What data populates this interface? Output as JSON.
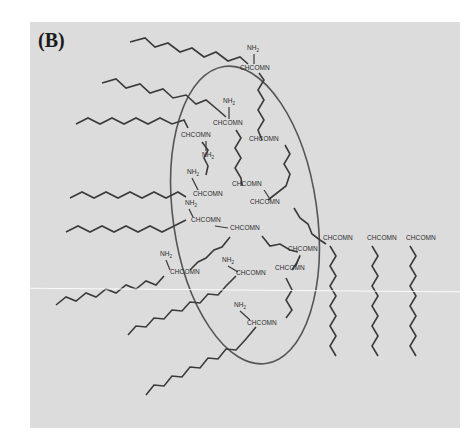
{
  "figure": {
    "panel_label": "(B)",
    "background_color": "#dcdcdc",
    "line_color": "#3a3a3a",
    "ellipse": {
      "cx": 245,
      "cy": 215,
      "rx": 72,
      "ry": 150,
      "rotation": -8
    }
  },
  "labels": [
    {
      "text": "NH2",
      "x": 247,
      "y": 50
    },
    {
      "text": "CHCOMN",
      "x": 240,
      "y": 70
    },
    {
      "text": "NH2",
      "x": 223,
      "y": 103
    },
    {
      "text": "CHCOMN",
      "x": 213,
      "y": 125
    },
    {
      "text": "CHCOMN",
      "x": 181,
      "y": 137
    },
    {
      "text": "CHCOMN",
      "x": 249,
      "y": 141
    },
    {
      "text": "NH2",
      "x": 202,
      "y": 157
    },
    {
      "text": "NH2",
      "x": 187,
      "y": 174
    },
    {
      "text": "CHCOMN",
      "x": 232,
      "y": 186
    },
    {
      "text": "CHCOMN",
      "x": 193,
      "y": 196
    },
    {
      "text": "NH2",
      "x": 185,
      "y": 205
    },
    {
      "text": "CHCOMN",
      "x": 250,
      "y": 204
    },
    {
      "text": "CHCOMN",
      "x": 191,
      "y": 222
    },
    {
      "text": "CHCOMN",
      "x": 230,
      "y": 230
    },
    {
      "text": "CHCOMN",
      "x": 288,
      "y": 251
    },
    {
      "text": "CHCOMN",
      "x": 323,
      "y": 240
    },
    {
      "text": "CHCOMN",
      "x": 367,
      "y": 240
    },
    {
      "text": "CHCOMN",
      "x": 406,
      "y": 240
    },
    {
      "text": "NH2",
      "x": 160,
      "y": 256
    },
    {
      "text": "CHCOMN",
      "x": 170,
      "y": 274
    },
    {
      "text": "NH2",
      "x": 222,
      "y": 262
    },
    {
      "text": "CHCOMN",
      "x": 236,
      "y": 275
    },
    {
      "text": "CHCOMN",
      "x": 275,
      "y": 270
    },
    {
      "text": "NH2",
      "x": 234,
      "y": 307
    },
    {
      "text": "CHCOMN",
      "x": 247,
      "y": 325
    }
  ],
  "chains": [
    {
      "name": "tail-top-1",
      "points": "130,42 145,38 155,47 168,43 180,52 192,48 204,57 216,52 228,61 240,57 248,64"
    },
    {
      "name": "tail-top-2",
      "points": "102,83 116,79 126,88 140,84 150,93 163,89 173,98 186,95 196,104 206,100 218,110 226,117"
    },
    {
      "name": "tail-top-3",
      "points": "76,124 88,118 100,124 112,118 124,124 136,118 148,124 160,118 172,124 184,120 188,128"
    },
    {
      "name": "tail-mid-1",
      "points": "70,198 82,192 94,198 106,192 118,198 130,192 142,198 154,192 166,198 178,192 186,197"
    },
    {
      "name": "tail-mid-2",
      "points": "66,232 78,226 90,232 102,226 114,232 126,226 138,232 150,226 162,232 174,226 186,220"
    },
    {
      "name": "tail-low-1",
      "points": "56,305 66,297 76,301 86,293 96,297 106,289 116,293 126,285 136,289 146,281 156,285 164,276"
    },
    {
      "name": "tail-low-2",
      "points": "128,335 136,326 146,327 154,318 164,319 172,310 182,311 190,302 200,303 208,294 218,295 226,286 236,276"
    },
    {
      "name": "tail-low-3",
      "points": "146,395 154,385 164,386 172,376 182,377 190,367 200,368 208,358 218,359 226,349 236,350 246,339 256,327"
    },
    {
      "name": "backbone-1",
      "points": "259,73 264,80 258,90 264,100 258,110 264,120 258,130 262,140"
    },
    {
      "name": "backbone-2",
      "points": "236,130 241,138 235,148 241,158 235,168 241,178 242,186"
    },
    {
      "name": "backbone-3",
      "points": "202,142 208,150 204,158 208,166 206,175"
    },
    {
      "name": "backbone-4",
      "points": "285,145 290,154 284,164 290,174 286,186 268,200"
    },
    {
      "name": "backbone-5",
      "points": "294,208 300,218 308,224 312,234 320,240 326,244"
    },
    {
      "name": "backbone-6",
      "points": "262,236 270,246 280,244 290,250 298,252"
    },
    {
      "name": "backbone-7",
      "points": "230,237 222,247 214,250 206,258 198,262 190,270"
    },
    {
      "name": "backbone-8",
      "points": "286,278 292,290 286,300 292,310 286,318"
    },
    {
      "name": "backbone-9",
      "points": "300,256 296,264 292,270"
    },
    {
      "name": "pendant-1",
      "points": "330,246 336,256 330,266 336,276 330,286 336,296 330,306 336,316 330,326 336,336 330,346 336,356"
    },
    {
      "name": "pendant-2",
      "points": "372,246 378,256 372,266 378,276 372,286 378,296 372,306 378,316 372,326 378,336 372,346 378,356"
    },
    {
      "name": "pendant-3",
      "points": "410,246 416,256 410,266 416,276 410,286 416,296 410,306 416,316 410,326 416,336 410,346 416,356"
    }
  ],
  "bonds": [
    {
      "x1": 254,
      "y1": 54,
      "x2": 254,
      "y2": 64
    },
    {
      "x1": 229,
      "y1": 107,
      "x2": 229,
      "y2": 119
    },
    {
      "x1": 206,
      "y1": 141,
      "x2": 206,
      "y2": 151
    },
    {
      "x1": 192,
      "y1": 178,
      "x2": 198,
      "y2": 190
    },
    {
      "x1": 189,
      "y1": 209,
      "x2": 193,
      "y2": 217
    },
    {
      "x1": 215,
      "y1": 226,
      "x2": 228,
      "y2": 228
    },
    {
      "x1": 264,
      "y1": 190,
      "x2": 270,
      "y2": 199
    },
    {
      "x1": 166,
      "y1": 260,
      "x2": 170,
      "y2": 270
    },
    {
      "x1": 228,
      "y1": 266,
      "x2": 238,
      "y2": 272
    },
    {
      "x1": 240,
      "y1": 311,
      "x2": 250,
      "y2": 320
    },
    {
      "x1": 300,
      "y1": 255,
      "x2": 296,
      "y2": 266
    }
  ]
}
